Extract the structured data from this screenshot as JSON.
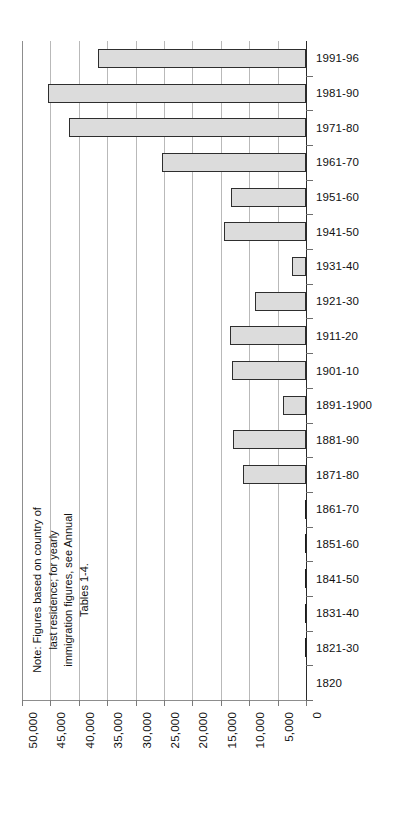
{
  "chart_data": {
    "type": "bar",
    "orientation": "horizontal",
    "title": "",
    "xlabel": "",
    "ylabel": "",
    "grid": true,
    "legend": "none",
    "axis_note": "Value axis runs right-to-left: 0 at right, 50,000 at left",
    "xlim": [
      0,
      50000
    ],
    "xticks": [
      50000,
      45000,
      40000,
      35000,
      30000,
      25000,
      20000,
      15000,
      10000,
      5000,
      0
    ],
    "xticklabels": [
      "50,000",
      "45,000",
      "40,000",
      "35,000",
      "30,000",
      "25,000",
      "20,000",
      "15,000",
      "10,000",
      "5,000",
      "0"
    ],
    "categories": [
      "1991-96",
      "1981-90",
      "1971-80",
      "1961-70",
      "1951-60",
      "1941-50",
      "1931-40",
      "1921-30",
      "1911-20",
      "1901-10",
      "1891-1900",
      "1881-90",
      "1871-80",
      "1861-70",
      "1851-60",
      "1841-50",
      "1831-40",
      "1821-30",
      "1820"
    ],
    "values": [
      36600,
      45400,
      41700,
      25300,
      13200,
      14500,
      2500,
      9000,
      13300,
      13000,
      4100,
      12900,
      11100,
      250,
      250,
      120,
      40,
      20,
      0
    ]
  },
  "note": {
    "lines": [
      "Note: Figures based on country of",
      "last residence; for yearly",
      "immigration figures, see Annual",
      "Tables 1-4."
    ]
  },
  "style": {
    "bar_fill": "#dcdcdc",
    "bar_border": "#2e2e2e",
    "gridline": "#b9b9b9",
    "axis": "#2a2a2a",
    "text": "#111111",
    "background": "#ffffff"
  }
}
